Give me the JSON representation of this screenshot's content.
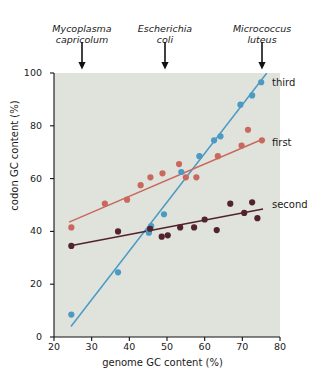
{
  "annotations": {
    "species": [
      {
        "name": "mycoplasma-capricolum",
        "label": "Mycoplasma\ncapricolum",
        "x_value": 25,
        "arrow_x": 82,
        "text_left": 34
      },
      {
        "name": "escherichia-coli",
        "label": "Escherichia\ncoli",
        "x_value": 49,
        "arrow_x": 165,
        "text_left": 117
      },
      {
        "name": "micrococcus-luteus",
        "label": "Micrococcus\nluteus",
        "x_value": 75,
        "arrow_x": 262,
        "text_left": 214
      }
    ]
  },
  "chart_data": {
    "type": "scatter",
    "title": "",
    "xlabel": "genome GC content (%)",
    "ylabel": "codon GC content (%)",
    "xlim": [
      20,
      80
    ],
    "ylim": [
      0,
      100
    ],
    "xticks": [
      20,
      30,
      40,
      50,
      60,
      70,
      80
    ],
    "yticks": [
      0,
      20,
      40,
      60,
      80,
      100
    ],
    "grid": false,
    "plot_background": "#dfe3dc",
    "legend_position": "inline-right",
    "series": [
      {
        "name": "third",
        "label": "third",
        "color": "#4a9ac4",
        "label_x": 272,
        "label_y": 77,
        "trend": {
          "x1": 24.5,
          "y1": 4,
          "x2": 76.5,
          "y2": 100
        },
        "points": [
          {
            "x": 24.6,
            "y": 8.5
          },
          {
            "x": 37.0,
            "y": 24.5
          },
          {
            "x": 45.2,
            "y": 39.5
          },
          {
            "x": 45.8,
            "y": 42.0
          },
          {
            "x": 49.2,
            "y": 46.5
          },
          {
            "x": 53.8,
            "y": 62.5
          },
          {
            "x": 58.6,
            "y": 68.5
          },
          {
            "x": 62.5,
            "y": 74.5
          },
          {
            "x": 64.2,
            "y": 76.0
          },
          {
            "x": 69.5,
            "y": 88.0
          },
          {
            "x": 72.6,
            "y": 91.5
          },
          {
            "x": 75.0,
            "y": 96.5
          }
        ]
      },
      {
        "name": "first",
        "label": "first",
        "color": "#c9695e",
        "label_x": 272,
        "label_y": 137,
        "trend": {
          "x1": 24.0,
          "y1": 43.5,
          "x2": 75.5,
          "y2": 75.0
        },
        "points": [
          {
            "x": 24.6,
            "y": 41.5
          },
          {
            "x": 33.5,
            "y": 50.5
          },
          {
            "x": 39.4,
            "y": 52.0
          },
          {
            "x": 43.0,
            "y": 57.5
          },
          {
            "x": 45.6,
            "y": 60.5
          },
          {
            "x": 48.8,
            "y": 62.0
          },
          {
            "x": 53.2,
            "y": 65.5
          },
          {
            "x": 55.0,
            "y": 60.5
          },
          {
            "x": 57.8,
            "y": 60.5
          },
          {
            "x": 63.5,
            "y": 68.5
          },
          {
            "x": 69.8,
            "y": 72.5
          },
          {
            "x": 71.5,
            "y": 78.5
          },
          {
            "x": 75.2,
            "y": 74.5
          }
        ]
      },
      {
        "name": "second",
        "label": "second",
        "color": "#52232b",
        "label_x": 272,
        "label_y": 199,
        "trend": {
          "x1": 24.0,
          "y1": 34.5,
          "x2": 75.5,
          "y2": 48.5
        },
        "points": [
          {
            "x": 24.6,
            "y": 34.5
          },
          {
            "x": 37.0,
            "y": 40.0
          },
          {
            "x": 45.5,
            "y": 41.0
          },
          {
            "x": 48.6,
            "y": 38.0
          },
          {
            "x": 50.2,
            "y": 38.5
          },
          {
            "x": 53.5,
            "y": 41.5
          },
          {
            "x": 57.2,
            "y": 41.5
          },
          {
            "x": 60.0,
            "y": 44.5
          },
          {
            "x": 63.2,
            "y": 40.5
          },
          {
            "x": 66.8,
            "y": 50.5
          },
          {
            "x": 70.5,
            "y": 47.0
          },
          {
            "x": 72.6,
            "y": 51.0
          },
          {
            "x": 74.0,
            "y": 45.0
          }
        ]
      }
    ]
  }
}
